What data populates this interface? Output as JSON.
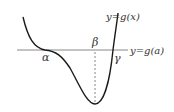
{
  "diagram": {
    "curve_label": "y=g(x)",
    "line_label": "y=g(a)",
    "points": {
      "alpha": "α",
      "beta": "β",
      "gamma": "γ"
    },
    "colors": {
      "curve": "#1a1a1a",
      "line": "#777777",
      "dashed": "#555555",
      "text": "#333333"
    }
  }
}
